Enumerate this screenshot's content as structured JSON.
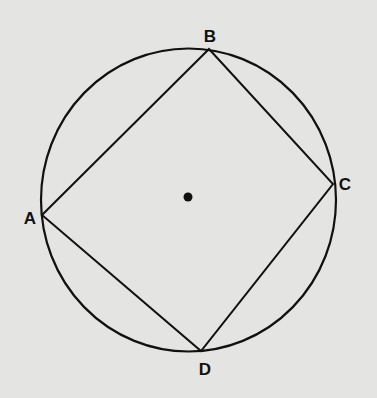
{
  "figure": {
    "type": "inscribed quadrilateral in circle",
    "background": "#e4e4e2",
    "stroke_color": "#111111",
    "circle": {
      "cx": 188.5,
      "cy": 200,
      "rx": 147.5,
      "ry": 151.5
    },
    "center_point": {
      "x": 188,
      "y": 197,
      "r": 4.5
    },
    "vertices": [
      {
        "label": "A",
        "x": 42,
        "y": 215,
        "label_x": 30,
        "label_y": 224
      },
      {
        "label": "B",
        "x": 209,
        "y": 49,
        "label_x": 210,
        "label_y": 42
      },
      {
        "label": "C",
        "x": 333,
        "y": 184,
        "label_x": 345,
        "label_y": 190
      },
      {
        "label": "D",
        "x": 201,
        "y": 351,
        "label_x": 205,
        "label_y": 375
      }
    ],
    "edges": [
      [
        "A",
        "B"
      ],
      [
        "B",
        "C"
      ],
      [
        "C",
        "D"
      ],
      [
        "D",
        "A"
      ]
    ]
  }
}
